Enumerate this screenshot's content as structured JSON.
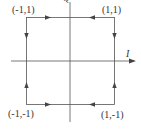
{
  "diagram": {
    "type": "signal constellation with transition arrows",
    "axes": {
      "horizontal_label": "I",
      "vertical_label": "Q"
    },
    "points": [
      {
        "id": "top-left",
        "label": "(-1,1)"
      },
      {
        "id": "top-right",
        "label": "(1,1)"
      },
      {
        "id": "bottom-left",
        "label": "(-1,-1)"
      },
      {
        "id": "bottom-right",
        "label": "(1,-1)"
      }
    ],
    "colors": {
      "line": "#555555",
      "text": "#333333",
      "background": "#ffffff"
    }
  }
}
